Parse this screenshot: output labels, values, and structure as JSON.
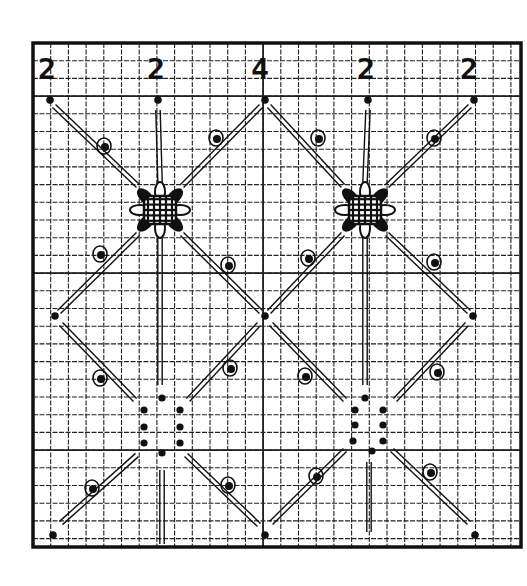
{
  "diagram": {
    "title": "",
    "kind": "lace stitch pattern on graph paper",
    "colors": {
      "ink": "#111111",
      "grid": "#222222",
      "paper": "#ffffff"
    },
    "frame": {
      "x": 33,
      "y": 43,
      "w": 488,
      "h": 504
    },
    "grid": {
      "cell": 17.7,
      "cols": 27,
      "rows": 28
    },
    "stitch_counts": [
      {
        "label": "2",
        "x": 50
      },
      {
        "label": "2",
        "x": 158
      },
      {
        "label": "4",
        "x": 262
      },
      {
        "label": "2",
        "x": 368
      },
      {
        "label": "2",
        "x": 474
      }
    ],
    "anchor_dots_top": [
      [
        50,
        100
      ],
      [
        158,
        100
      ],
      [
        265,
        100
      ],
      [
        368,
        100
      ],
      [
        474,
        100
      ]
    ],
    "anchor_dots_mid": [
      [
        55,
        316
      ],
      [
        265,
        316
      ],
      [
        473,
        316
      ]
    ],
    "anchor_dots_bottom": [
      [
        53,
        535
      ],
      [
        265,
        535
      ],
      [
        475,
        535
      ]
    ],
    "stars": [
      {
        "cx": 160,
        "cy": 210
      },
      {
        "cx": 365,
        "cy": 210
      }
    ],
    "dot_groups": [
      {
        "cx": 162,
        "dots": [
          [
            162,
            398
          ],
          [
            144,
            410
          ],
          [
            180,
            410
          ],
          [
            144,
            427
          ],
          [
            180,
            427
          ],
          [
            144,
            443
          ],
          [
            180,
            443
          ],
          [
            162,
            453
          ]
        ]
      },
      {
        "cx": 365,
        "dots": [
          [
            365,
            398
          ],
          [
            355,
            410
          ],
          [
            383,
            410
          ],
          [
            355,
            425
          ],
          [
            383,
            425
          ],
          [
            353,
            441
          ],
          [
            383,
            441
          ],
          [
            372,
            451
          ]
        ]
      }
    ],
    "picots": [
      [
        104,
        146
      ],
      [
        216,
        138
      ],
      [
        318,
        138
      ],
      [
        434,
        138
      ],
      [
        100,
        254
      ],
      [
        228,
        265
      ],
      [
        308,
        258
      ],
      [
        434,
        262
      ],
      [
        100,
        378
      ],
      [
        230,
        368
      ],
      [
        305,
        376
      ],
      [
        437,
        372
      ],
      [
        92,
        488
      ],
      [
        228,
        485
      ],
      [
        316,
        476
      ],
      [
        430,
        472
      ]
    ]
  }
}
